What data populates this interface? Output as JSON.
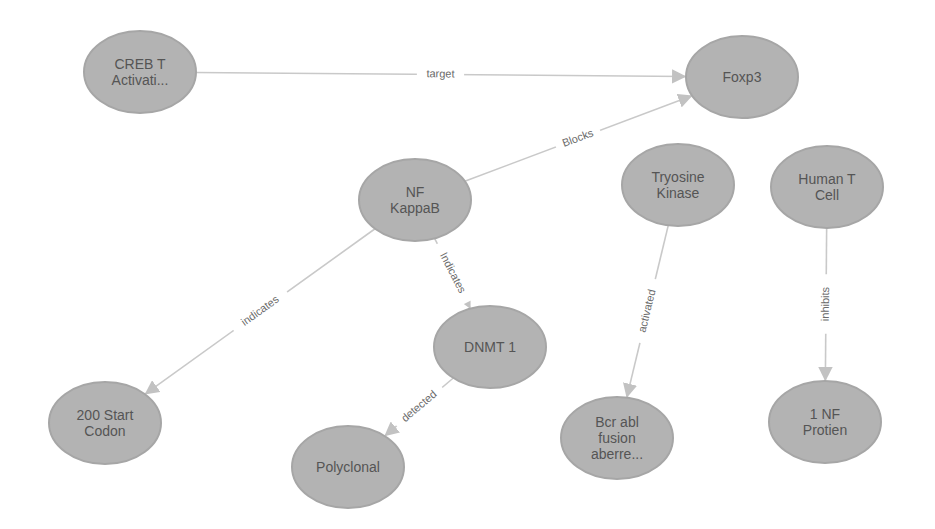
{
  "graph": {
    "node_style": {
      "fill": "#b3b3b3",
      "stroke": "#a6a6a6",
      "text_color": "#555555",
      "rx": 56,
      "ry": 41
    },
    "edge_style": {
      "stroke": "#c9c9c9",
      "label_color": "#6a6a6a"
    },
    "nodes": [
      {
        "id": "creb",
        "lines": [
          "CREB T",
          "Activati..."
        ],
        "x": 140,
        "y": 72
      },
      {
        "id": "foxp3",
        "lines": [
          "Foxp3"
        ],
        "x": 742,
        "y": 77
      },
      {
        "id": "nfkappab",
        "lines": [
          "NF",
          "KappaB"
        ],
        "x": 415,
        "y": 200
      },
      {
        "id": "tryosine",
        "lines": [
          "Tryosine",
          "Kinase"
        ],
        "x": 678,
        "y": 185
      },
      {
        "id": "humant",
        "lines": [
          "Human T",
          "Cell"
        ],
        "x": 827,
        "y": 187
      },
      {
        "id": "dnmt1",
        "lines": [
          "DNMT 1"
        ],
        "x": 490,
        "y": 347
      },
      {
        "id": "start200",
        "lines": [
          "200 Start",
          "Codon"
        ],
        "x": 105,
        "y": 423
      },
      {
        "id": "polyclonal",
        "lines": [
          "Polyclonal"
        ],
        "x": 348,
        "y": 467
      },
      {
        "id": "bcrabl",
        "lines": [
          "Bcr abl",
          "fusion",
          "aberre..."
        ],
        "x": 617,
        "y": 438
      },
      {
        "id": "nfprotien",
        "lines": [
          "1 NF",
          "Protien"
        ],
        "x": 825,
        "y": 422
      }
    ],
    "edges": [
      {
        "from": "creb",
        "to": "foxp3",
        "label": "target"
      },
      {
        "from": "nfkappab",
        "to": "foxp3",
        "label": "Blocks"
      },
      {
        "from": "nfkappab",
        "to": "start200",
        "label": "indicates"
      },
      {
        "from": "nfkappab",
        "to": "dnmt1",
        "label": "Indicates"
      },
      {
        "from": "dnmt1",
        "to": "polyclonal",
        "label": "detected"
      },
      {
        "from": "tryosine",
        "to": "bcrabl",
        "label": "activated"
      },
      {
        "from": "humant",
        "to": "nfprotien",
        "label": "inhibits"
      }
    ]
  }
}
